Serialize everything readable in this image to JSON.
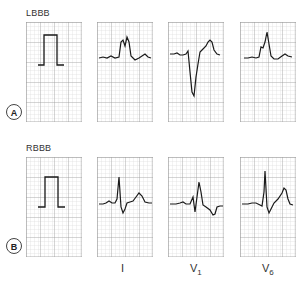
{
  "figure": {
    "rows": [
      {
        "id": "A",
        "title": "LBBB",
        "marker": "A"
      },
      {
        "id": "B",
        "title": "RBBB",
        "marker": "B"
      }
    ],
    "leads": [
      {
        "label": "I",
        "sub": ""
      },
      {
        "label": "V",
        "sub": "1"
      },
      {
        "label": "V",
        "sub": "6"
      }
    ],
    "colors": {
      "grid_minor": "#d6d6d6",
      "grid_major": "#9a9a9a",
      "trace": "#1a1a1a",
      "background": "#ffffff"
    }
  }
}
